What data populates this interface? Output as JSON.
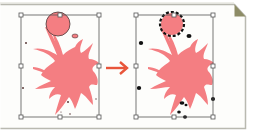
{
  "diagram": {
    "title": "",
    "colors": {
      "frame_border": "#b9b9b0",
      "fold_fill": "#8d8c66",
      "splat_fill": "#f47e82",
      "arrow": "#e8553a",
      "bbox_line": "#555555",
      "handle_fill": "#ffffff",
      "speck_after": "#111111",
      "speck_before": "#5a3a3a"
    },
    "panels": [
      {
        "id": "before",
        "label": "",
        "bbox": {
          "x": 21,
          "y": 15,
          "w": 78,
          "h": 102
        },
        "circle": {
          "cx": 58,
          "cy": 24,
          "r": 12,
          "outline": "solid-thin"
        }
      },
      {
        "id": "after",
        "label": "",
        "bbox": {
          "x": 136,
          "y": 15,
          "w": 77,
          "h": 102
        },
        "circle": {
          "cx": 172,
          "cy": 24,
          "r": 11,
          "outline": "dashed-black"
        }
      }
    ],
    "arrow": {
      "from_x": 106,
      "to_x": 128,
      "y": 68,
      "direction": "right"
    }
  }
}
